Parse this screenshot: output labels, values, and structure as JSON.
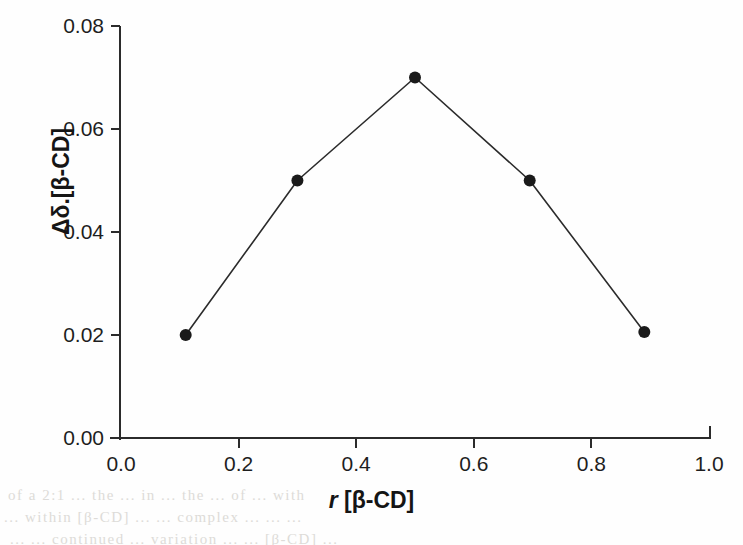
{
  "figure": {
    "background_color": "#fefefe",
    "ink_color": "#1e1e1e",
    "line_color": "#2b2b2b",
    "marker_color": "#1a1a1a"
  },
  "ghost_text": {
    "line1": "of  a  2:1  ...  the  ...  in  ...  the  ...  of  ...  with",
    "line2": "...  within  [β-CD]  ...  ...  complex  ...  ...  ...",
    "line3": "...  ...  continued  ...  variation  ...  ...  [β-CD]  ...",
    "line4": " "
  },
  "chart_data": {
    "type": "line",
    "title": "",
    "subtitle": "",
    "xlabel": "r [β-CD]",
    "xlabel_italic_part": "r",
    "xlabel_rest": " [β-CD]",
    "ylabel": "Δδ.[β-CD]",
    "xlim": [
      0.0,
      1.0
    ],
    "ylim": [
      0.0,
      0.08
    ],
    "xticks": [
      0.0,
      0.2,
      0.4,
      0.6,
      0.8,
      1.0
    ],
    "xticklabels": [
      "0.0",
      "0.2",
      "0.4",
      "0.6",
      "0.8",
      "1.0"
    ],
    "yticks": [
      0.0,
      0.02,
      0.04,
      0.06,
      0.08
    ],
    "yticklabels": [
      "0.00",
      "0.02",
      "0.04",
      "0.06",
      "0.08"
    ],
    "grid": false,
    "legend": false,
    "legend_position": "none",
    "marker": "filled-circle",
    "marker_size": 12,
    "line_width": 1.6,
    "x": [
      0.11,
      0.3,
      0.5,
      0.695,
      0.89
    ],
    "y": [
      0.02,
      0.05,
      0.07,
      0.05,
      0.0206
    ],
    "series": [
      {
        "name": "Δδ.[β-CD] vs r [β-CD]",
        "points": [
          {
            "x": 0.11,
            "y": 0.02
          },
          {
            "x": 0.3,
            "y": 0.05
          },
          {
            "x": 0.5,
            "y": 0.07
          },
          {
            "x": 0.695,
            "y": 0.05
          },
          {
            "x": 0.89,
            "y": 0.0206
          }
        ]
      }
    ],
    "annotations": []
  }
}
